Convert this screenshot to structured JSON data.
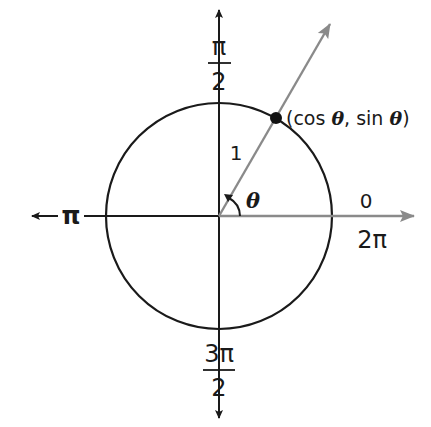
{
  "diagram": {
    "center": {
      "x": 219,
      "y": 216
    },
    "radius": 113,
    "angle_deg": 60,
    "colors": {
      "circle": "#1a1a1a",
      "axes": "#1a1a1a",
      "ray": "#8a8a8a",
      "positive_x_axis": "#8a8a8a",
      "point": "#111111"
    },
    "labels": {
      "top_num": "π",
      "top_den": "2",
      "left": "π",
      "right_above": "0",
      "right_below": "2π",
      "bottom_num": "3π",
      "bottom_den": "2",
      "radius": "1",
      "angle": "θ",
      "point_prefix": "(cos ",
      "point_theta1": "θ",
      "point_mid": ", sin ",
      "point_theta2": "θ",
      "point_suffix": ")"
    }
  }
}
